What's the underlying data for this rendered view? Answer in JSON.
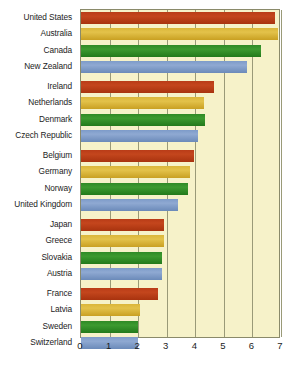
{
  "chart_data": {
    "type": "bar",
    "orientation": "horizontal",
    "title": "",
    "subtitle": "",
    "xlabel": "",
    "ylabel": "",
    "xlim": [
      0,
      7
    ],
    "xticks": [
      0,
      1,
      2,
      3,
      4,
      5,
      6,
      7
    ],
    "xtick_labels": [
      "0",
      "1",
      "2",
      "3",
      "4",
      "5",
      "6",
      "7"
    ],
    "grid": true,
    "legend": "none",
    "categories": [
      "United States",
      "Australia",
      "Canada",
      "New Zealand",
      "Ireland",
      "Netherlands",
      "Denmark",
      "Czech Republic",
      "Belgium",
      "Germany",
      "Norway",
      "United Kingdom",
      "Japan",
      "Greece",
      "Slovakia",
      "Austria",
      "France",
      "Latvia",
      "Sweden",
      "Switzerland"
    ],
    "values": [
      6.8,
      6.9,
      6.3,
      5.8,
      4.65,
      4.3,
      4.35,
      4.1,
      3.95,
      3.8,
      3.75,
      3.4,
      2.9,
      2.9,
      2.85,
      2.85,
      2.7,
      2.05,
      2.0,
      2.0
    ],
    "group_breaks_after": [
      3,
      7,
      11,
      15
    ],
    "colors": [
      "#b93c18",
      "#dbb63a",
      "#2f8a26",
      "#7d9bc9"
    ],
    "plot_background": "#f6f2c9",
    "gridline_color": "#9a9a78",
    "axis_border_color": "#8a8a6a",
    "label_color": "#1c1c1c"
  }
}
